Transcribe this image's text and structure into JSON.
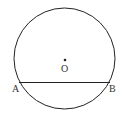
{
  "diagram": {
    "center_label": "O",
    "point_a_label": "A",
    "point_b_label": "B",
    "stroke_color": "#222222"
  }
}
